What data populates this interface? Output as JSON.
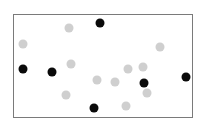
{
  "colors": {
    "black": "#0a0a0a",
    "gray": "#cfcfcf",
    "frame": "#7a7a7a"
  },
  "dots": [
    {
      "x": 100,
      "y": 23,
      "color": "black"
    },
    {
      "x": 23,
      "y": 69,
      "color": "black"
    },
    {
      "x": 52,
      "y": 72,
      "color": "black"
    },
    {
      "x": 144,
      "y": 83,
      "color": "black"
    },
    {
      "x": 186,
      "y": 77,
      "color": "black"
    },
    {
      "x": 94,
      "y": 108,
      "color": "black"
    },
    {
      "x": 69,
      "y": 28,
      "color": "gray"
    },
    {
      "x": 23,
      "y": 44,
      "color": "gray"
    },
    {
      "x": 160,
      "y": 47,
      "color": "gray"
    },
    {
      "x": 71,
      "y": 64,
      "color": "gray"
    },
    {
      "x": 128,
      "y": 69,
      "color": "gray"
    },
    {
      "x": 143,
      "y": 67,
      "color": "gray"
    },
    {
      "x": 97,
      "y": 80,
      "color": "gray"
    },
    {
      "x": 115,
      "y": 82,
      "color": "gray"
    },
    {
      "x": 147,
      "y": 93,
      "color": "gray"
    },
    {
      "x": 66,
      "y": 95,
      "color": "gray"
    },
    {
      "x": 126,
      "y": 106,
      "color": "gray"
    }
  ]
}
